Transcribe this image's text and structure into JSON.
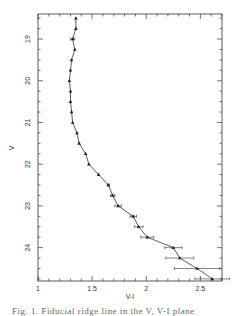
{
  "chart_data": {
    "type": "line",
    "title": "",
    "xlabel": "V-I",
    "ylabel": "V",
    "xlim": [
      1.0,
      2.7
    ],
    "ylim": [
      24.8,
      18.4
    ],
    "y_inverted": true,
    "grid": false,
    "legend": null,
    "x_ticks": [
      1,
      1.5,
      2,
      2.5
    ],
    "x_tick_labels": [
      "1",
      "1.5",
      "2",
      "2.5"
    ],
    "y_ticks": [
      19,
      20,
      21,
      22,
      23,
      24
    ],
    "y_tick_labels": [
      "19",
      "20",
      "21",
      "22",
      "23",
      "24"
    ],
    "marker": "triangle",
    "series": [
      {
        "name": "ridge line",
        "points": [
          {
            "x": 1.35,
            "y": 18.5,
            "xerr": 0.0
          },
          {
            "x": 1.35,
            "y": 18.75,
            "xerr": 0.0
          },
          {
            "x": 1.32,
            "y": 19.0,
            "xerr": 0.02
          },
          {
            "x": 1.34,
            "y": 19.25,
            "xerr": 0.0
          },
          {
            "x": 1.31,
            "y": 19.5,
            "xerr": 0.0
          },
          {
            "x": 1.3,
            "y": 19.75,
            "xerr": 0.0
          },
          {
            "x": 1.29,
            "y": 20.0,
            "xerr": 0.0
          },
          {
            "x": 1.3,
            "y": 20.25,
            "xerr": 0.0
          },
          {
            "x": 1.3,
            "y": 20.5,
            "xerr": 0.0
          },
          {
            "x": 1.31,
            "y": 20.75,
            "xerr": 0.0
          },
          {
            "x": 1.32,
            "y": 21.0,
            "xerr": 0.0
          },
          {
            "x": 1.36,
            "y": 21.25,
            "xerr": 0.0
          },
          {
            "x": 1.38,
            "y": 21.5,
            "xerr": 0.0
          },
          {
            "x": 1.44,
            "y": 21.75,
            "xerr": 0.0
          },
          {
            "x": 1.47,
            "y": 22.0,
            "xerr": 0.0
          },
          {
            "x": 1.56,
            "y": 22.25,
            "xerr": 0.0
          },
          {
            "x": 1.65,
            "y": 22.5,
            "xerr": 0.01
          },
          {
            "x": 1.69,
            "y": 22.75,
            "xerr": 0.02
          },
          {
            "x": 1.74,
            "y": 23.0,
            "xerr": 0.03
          },
          {
            "x": 1.88,
            "y": 23.25,
            "xerr": 0.03
          },
          {
            "x": 1.93,
            "y": 23.5,
            "xerr": 0.04
          },
          {
            "x": 2.01,
            "y": 23.75,
            "xerr": 0.06
          },
          {
            "x": 2.25,
            "y": 24.0,
            "xerr": 0.08
          },
          {
            "x": 2.31,
            "y": 24.25,
            "xerr": 0.13
          },
          {
            "x": 2.47,
            "y": 24.5,
            "xerr": 0.21
          },
          {
            "x": 2.61,
            "y": 24.75,
            "xerr": 0.16
          }
        ]
      }
    ]
  },
  "caption": {
    "text": "Fig. 1. Fiducial ridge line in the V, V-I plane"
  }
}
